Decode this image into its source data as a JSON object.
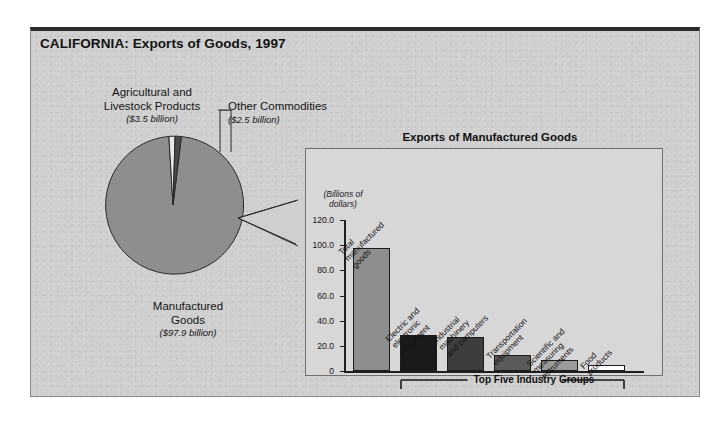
{
  "figure": {
    "title": "CALIFORNIA: Exports of Goods, 1997",
    "panel_title": "Exports of Manufactured Goods",
    "axis_caption_line1": "(Billions of",
    "axis_caption_line2": "dollars)",
    "bracket_label": "Top Five Industry Groups"
  },
  "pie_labels": {
    "agricultural_name_l1": "Agricultural and",
    "agricultural_name_l2": "Livestock Products",
    "agricultural_amount": "($3.5 billion)",
    "other_name": "Other Commodities",
    "other_amount": "($2.5 billion)",
    "manufactured_name_l1": "Manufactured",
    "manufactured_name_l2": "Goods",
    "manufactured_amount": "($97.9 billion)"
  },
  "colors": {
    "background": "#cfcfcf",
    "panel_bg": "#d7d7d7",
    "pie_manufactured": "#8e8e8e",
    "pie_agricultural": "#e8e8e8",
    "pie_other": "#4a4a4a",
    "bar_total": "#8e8e8e",
    "bar_electric": "#1a1a1a",
    "bar_industrial": "#3d3d3d",
    "bar_transportation": "#5a5a5a",
    "bar_scientific": "#9b9b9b",
    "bar_food": "#ffffff",
    "frame_top": "#2b2b2b"
  },
  "chart_data": [
    {
      "type": "pie",
      "title": "CALIFORNIA: Exports of Goods, 1997",
      "unit": "billions of dollars",
      "categories": [
        "Manufactured Goods",
        "Agricultural and Livestock Products",
        "Other Commodities"
      ],
      "values": [
        97.9,
        3.5,
        2.5
      ],
      "value_labels": [
        "($97.9 billion)",
        "($3.5 billion)",
        "($2.5 billion)"
      ],
      "percentages": [
        94.2,
        3.4,
        2.4
      ],
      "total": 103.9,
      "legend": "labels with leader lines"
    },
    {
      "type": "bar",
      "title": "Exports of Manufactured Goods",
      "ylabel": "(Billions of dollars)",
      "xlabel": "",
      "ylim": [
        0,
        120
      ],
      "yticks": [
        0,
        20,
        40,
        60,
        80,
        100,
        120
      ],
      "ytick_labels": [
        "0",
        "20.0",
        "40.0",
        "60.0",
        "80.0",
        "100.0",
        "120.0"
      ],
      "grid": false,
      "categories": [
        "Total manufactured goods",
        "Electric and electronic equipment",
        "Industrial machinery and computers",
        "Transportation equipment",
        "Scientific and measuring instruments",
        "Food products"
      ],
      "category_lines": [
        [
          "Total",
          "manufactured",
          "goods"
        ],
        [
          "Electric and",
          "electronic",
          "equipment"
        ],
        [
          "Industrial",
          "machinery",
          "and computers"
        ],
        [
          "Transportation",
          "equipment"
        ],
        [
          "Scientific and",
          "measuring",
          "instruments"
        ],
        [
          "Food",
          "products"
        ]
      ],
      "values": [
        97.9,
        28.5,
        27.0,
        13.0,
        9.0,
        5.0
      ],
      "annotation": "Top Five Industry Groups"
    }
  ]
}
